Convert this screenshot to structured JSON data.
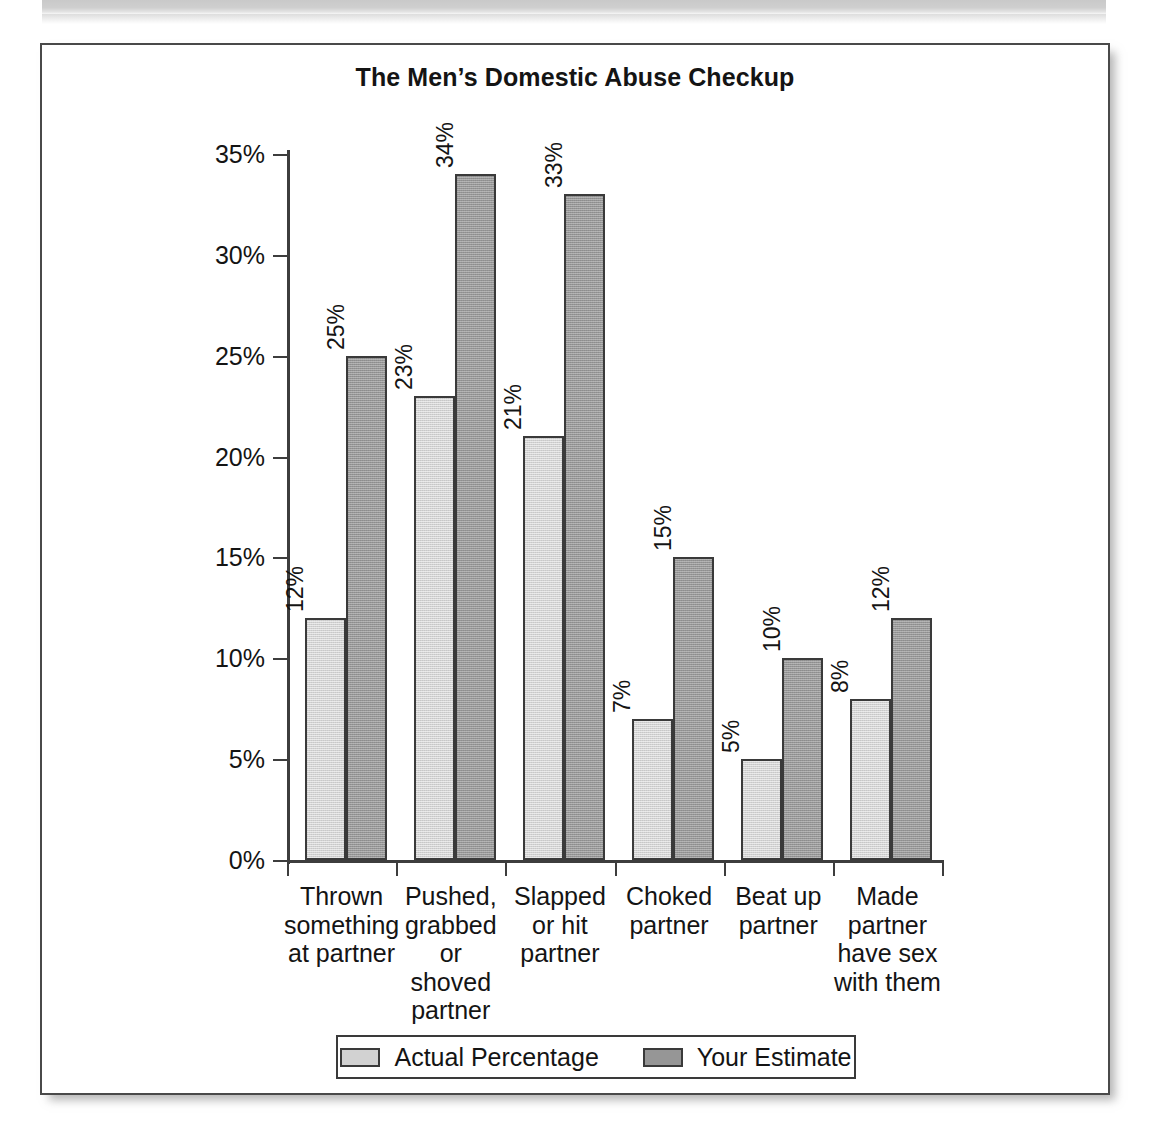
{
  "page": {
    "header_band": "scanned-page-header-band"
  },
  "chart_data": {
    "type": "bar",
    "title": "The Men’s Domestic Abuse Checkup",
    "xlabel": "",
    "ylabel": "",
    "ylim": [
      0,
      35
    ],
    "grid": false,
    "legend_position": "bottom",
    "y_tick_labels": [
      "0%",
      "5%",
      "10%",
      "15%",
      "20%",
      "25%",
      "30%",
      "35%"
    ],
    "y_ticks": [
      0,
      5,
      10,
      15,
      20,
      25,
      30,
      35
    ],
    "categories": [
      "Thrown something at partner",
      "Pushed, grabbed or shoved partner",
      "Slapped or hit partner",
      "Choked partner",
      "Beat up partner",
      "Made partner have sex with them"
    ],
    "category_label_lines": [
      [
        "Thrown",
        "something",
        "at partner"
      ],
      [
        "Pushed,",
        "grabbed",
        "or",
        "shoved",
        "partner"
      ],
      [
        "Slapped",
        "or hit",
        "partner"
      ],
      [
        "Choked",
        "partner"
      ],
      [
        "Beat up",
        "partner"
      ],
      [
        "Made",
        "partner",
        "have sex",
        "with them"
      ]
    ],
    "series": [
      {
        "name": "Actual Percentage",
        "color": "#d2d2d2",
        "values": [
          12,
          23,
          21,
          7,
          5,
          8
        ],
        "data_labels": [
          "12%",
          "23%",
          "21%",
          "7%",
          "5%",
          "8%"
        ]
      },
      {
        "name": "Your Estimate",
        "color": "#969696",
        "values": [
          25,
          34,
          33,
          15,
          10,
          12
        ],
        "data_labels": [
          "25%",
          "34%",
          "33%",
          "15%",
          "10%",
          "12%"
        ]
      }
    ]
  },
  "legend": {
    "items": [
      {
        "label": "Actual Percentage",
        "color": "#d2d2d2"
      },
      {
        "label": "Your Estimate",
        "color": "#969696"
      }
    ]
  },
  "colors": {
    "actual": "#d2d2d2",
    "estimate": "#969696",
    "outline": "#3a3a3a",
    "axis": "#3d3d3d",
    "text": "#141414"
  }
}
